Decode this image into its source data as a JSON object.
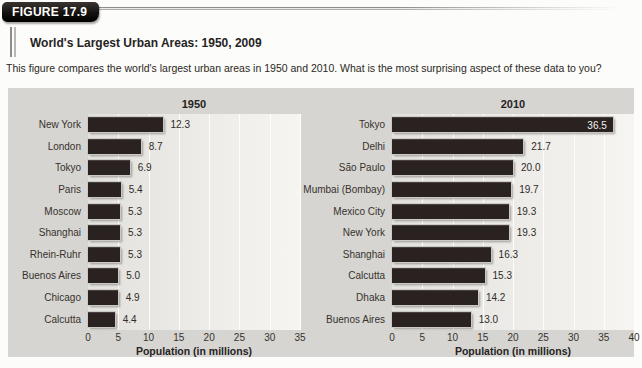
{
  "figure": {
    "badge": "FIGURE 17.9",
    "subtitle": "World's Largest Urban Areas: 1950, 2009",
    "description": "This figure compares the world's largest urban areas in 1950 and 2010. What is the most surprising aspect of these data to you?"
  },
  "colors": {
    "bar_fill": "#2a2220",
    "panel_background": "#d6d5d1",
    "badge_background": "#15110e",
    "badge_text": "#ffffff"
  },
  "chart_data": [
    {
      "type": "bar",
      "orientation": "horizontal",
      "title": "1950",
      "xlabel": "Population (in millions)",
      "xlim": [
        0,
        35
      ],
      "ticks": [
        0,
        5,
        10,
        15,
        20,
        25,
        30,
        35
      ],
      "grid": true,
      "categories": [
        "New York",
        "London",
        "Tokyo",
        "Paris",
        "Moscow",
        "Shanghai",
        "Rhein-Ruhr",
        "Buenos Aires",
        "Chicago",
        "Calcutta"
      ],
      "values": [
        12.3,
        8.7,
        6.9,
        5.4,
        5.3,
        5.3,
        5.3,
        5.0,
        4.9,
        4.4
      ]
    },
    {
      "type": "bar",
      "orientation": "horizontal",
      "title": "2010",
      "xlabel": "Population (in millions)",
      "xlim": [
        0,
        40
      ],
      "ticks": [
        0,
        5,
        10,
        15,
        20,
        25,
        30,
        35,
        40
      ],
      "grid": true,
      "categories": [
        "Tokyo",
        "Delhi",
        "São Paulo",
        "Mumbai (Bombay)",
        "Mexico City",
        "New York",
        "Shanghai",
        "Calcutta",
        "Dhaka",
        "Buenos Aires"
      ],
      "values": [
        36.5,
        21.7,
        20.0,
        19.7,
        19.3,
        19.3,
        16.3,
        15.3,
        14.2,
        13.0
      ]
    }
  ]
}
